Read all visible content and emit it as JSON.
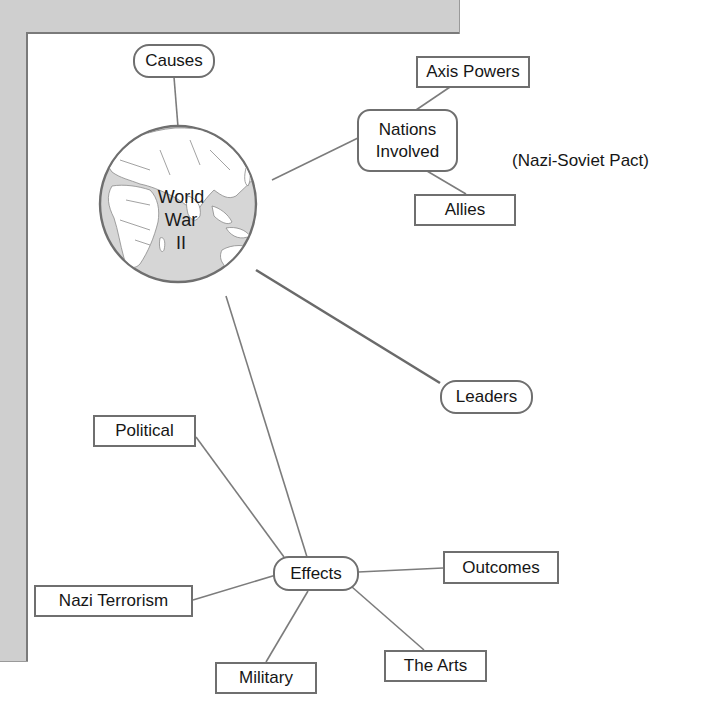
{
  "diagram": {
    "title": "World War II",
    "type": "concept-web",
    "colors": {
      "panel": "#cfcfcf",
      "panel_edge": "#7a7a7a",
      "node_border": "#6f6f6f",
      "link": "#7c7c7c",
      "globe_fill": "#d6d6d6",
      "land_fill": "#ffffff",
      "text": "#161616"
    },
    "center": {
      "label_line1": "World",
      "label_line2": "War",
      "label_line3": "II",
      "icon": "globe-icon"
    },
    "nodes": {
      "causes": "Causes",
      "nations_involved_line1": "Nations",
      "nations_involved_line2": "Involved",
      "axis_powers": "Axis Powers",
      "allies": "Allies",
      "leaders": "Leaders",
      "effects": "Effects",
      "political": "Political",
      "nazi_terrorism": "Nazi Terrorism",
      "military": "Military",
      "the_arts": "The Arts",
      "outcomes": "Outcomes"
    },
    "annotation": "(Nazi-Soviet Pact)"
  }
}
